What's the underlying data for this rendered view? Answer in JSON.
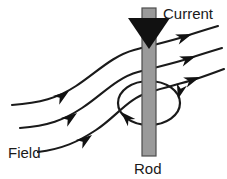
{
  "figure": {
    "background_color": "#ffffff",
    "width": 227,
    "height": 179
  },
  "labels": {
    "current": "Current",
    "field": "Field",
    "rod": "Rod"
  },
  "colors": {
    "rod_fill": "#9a9a9a",
    "rod_stroke": "#4d4d4d",
    "line_stroke": "#1a1a1a",
    "arrow_fill": "#111111",
    "text": "#1a1a1a"
  },
  "elements": {
    "rod": {
      "name": "vertical-rod",
      "x": 142,
      "y": 8,
      "width": 14,
      "height": 148,
      "fill": "#9a9a9a"
    },
    "current_arrow": {
      "name": "current-direction-arrow",
      "direction": "down",
      "tip_x": 149,
      "tip_y": 48,
      "half_width": 21,
      "top_y": 18
    },
    "circulation_loop": {
      "name": "field-circulation-ellipse",
      "center_x": 149,
      "center_y": 103,
      "radius_x": 31,
      "radius_y": 22,
      "arrow_count": 2,
      "sense": "counterclockwise-viewed-from-above"
    },
    "field_lines": {
      "count": 3,
      "incoming_side": "left",
      "outgoing_side": "right",
      "arrow_direction": "up-right"
    }
  }
}
